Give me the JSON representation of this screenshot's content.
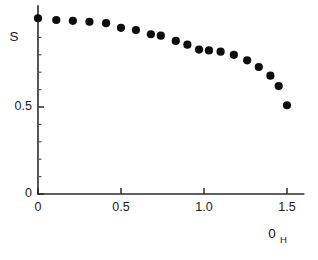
{
  "chart_data": {
    "type": "scatter",
    "title": "",
    "subtitle": "",
    "xlabel": "0",
    "xlabel_subscript": "H",
    "ylabel": "S",
    "xlim": [
      0,
      1.6
    ],
    "ylim": [
      0,
      1.08
    ],
    "grid": false,
    "legend": null,
    "marker": "filled-circle",
    "marker_color": "#0d0d0d",
    "x_ticks": [
      0,
      0.5,
      1.0,
      1.5
    ],
    "x_ticklabels": [
      "0",
      "0.5",
      "1.0",
      "1.5"
    ],
    "x_minor_ticks": [],
    "y_ticks": [
      0,
      0.5
    ],
    "y_ticklabels": [
      "0",
      "0.5"
    ],
    "y_minor_ticks": [
      0.1,
      0.2,
      0.3,
      0.4,
      0.6,
      0.7,
      0.8,
      0.9,
      1.0
    ],
    "series": [
      {
        "name": "S",
        "x": [
          0.0,
          0.11,
          0.21,
          0.31,
          0.41,
          0.5,
          0.59,
          0.68,
          0.74,
          0.83,
          0.9,
          0.97,
          1.03,
          1.1,
          1.18,
          1.26,
          1.33,
          1.4,
          1.45,
          1.5
        ],
        "y": [
          1.01,
          1.0,
          0.995,
          0.99,
          0.982,
          0.955,
          0.942,
          0.918,
          0.91,
          0.88,
          0.858,
          0.83,
          0.825,
          0.818,
          0.8,
          0.768,
          0.73,
          0.68,
          0.62,
          0.51
        ]
      }
    ]
  },
  "axes": {
    "x_axis_name": "x-axis",
    "y_axis_name": "y-axis"
  }
}
